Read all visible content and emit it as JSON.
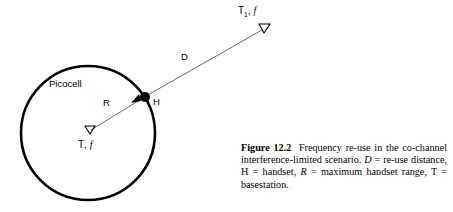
{
  "figure": {
    "number_label": "Figure 12.2",
    "caption_text": "Frequency re-use in the co-channel interference-limited scenario. D = re-use distance, H = handset, R = maximum handset range, T = basestation.",
    "caption_segments": {
      "s1": "Frequency re-use in the co-channel interference-limited scenario. ",
      "v1": "D",
      "s2": " = re-use distance, H = handset, ",
      "v2": "R",
      "s3": " = maximum handset range, T = basestation."
    }
  },
  "diagram": {
    "cell_label": "Picocell",
    "radius_label": "R",
    "distance_label": "D",
    "handset_label": "H",
    "basestation_center": {
      "symbol": "T",
      "subscript": "",
      "separator": ", ",
      "frequency": "f"
    },
    "basestation_remote": {
      "symbol": "T",
      "subscript": "1",
      "separator": ", ",
      "frequency": "f"
    },
    "geometry": {
      "circle_center_x": 88,
      "circle_center_y": 133,
      "circle_radius": 67,
      "handset_x": 145,
      "handset_y": 97,
      "remote_antenna_x": 264,
      "remote_antenna_y": 29
    },
    "colors": {
      "stroke": "#000000",
      "background": "#ffffff",
      "thin_line": "#555555"
    }
  }
}
